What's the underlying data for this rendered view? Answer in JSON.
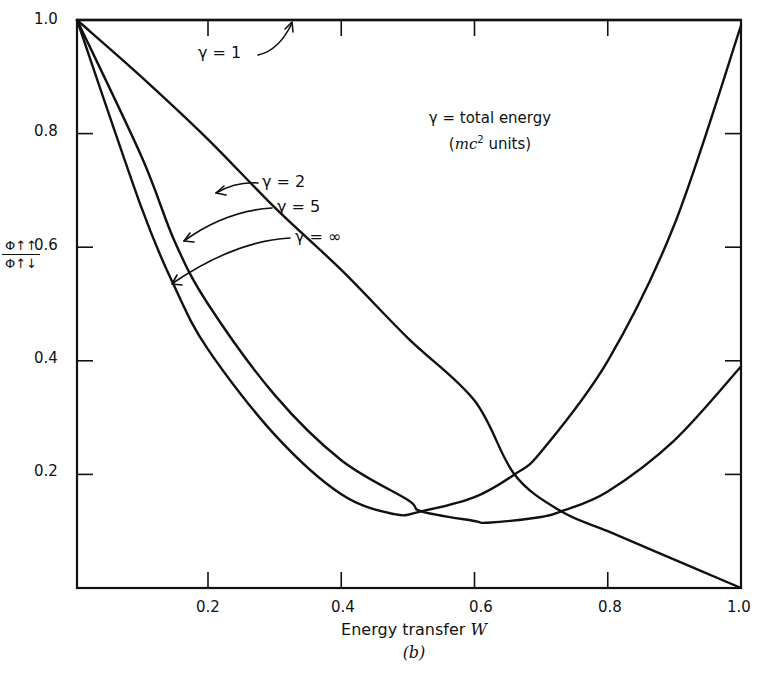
{
  "chart_data": {
    "type": "line",
    "title": "",
    "subtitle": "(b)",
    "xlabel": "Energy transfer W",
    "ylabel": "Φ↑↑ / Φ↑↓",
    "xlim": [
      0.035,
      1.0
    ],
    "ylim": [
      0.0,
      1.0
    ],
    "x_ticks": [
      0.2,
      0.4,
      0.6,
      0.8,
      1.0
    ],
    "x_tick_labels": [
      "0.2",
      "0.4",
      "0.6",
      "0.8",
      "1.0"
    ],
    "y_ticks": [
      0.2,
      0.4,
      0.6,
      0.8,
      1.0
    ],
    "y_tick_labels": [
      "0.2",
      "0.4",
      "0.6",
      "0.8",
      "1.0"
    ],
    "grid": false,
    "legend": "inline annotations with arrows",
    "annotation_note": [
      "γ = total energy",
      "(mc² units)"
    ],
    "series": [
      {
        "name": "γ = 1",
        "x": [
          0.035,
          0.2,
          0.4,
          0.6,
          0.8,
          1.0
        ],
        "y": [
          1.0,
          1.0,
          1.0,
          1.0,
          1.0,
          1.0
        ]
      },
      {
        "name": "γ = 2",
        "x": [
          0.035,
          0.1,
          0.2,
          0.3,
          0.4,
          0.5,
          0.6,
          0.66,
          0.73,
          0.8,
          0.9,
          1.0
        ],
        "y": [
          1.0,
          0.9,
          0.79,
          0.67,
          0.56,
          0.44,
          0.33,
          0.2,
          0.135,
          0.1,
          0.05,
          0.0
        ]
      },
      {
        "name": "γ = 5",
        "x": [
          0.035,
          0.1,
          0.15,
          0.2,
          0.3,
          0.4,
          0.5,
          0.52,
          0.6,
          0.62,
          0.7,
          0.73,
          0.8,
          0.9,
          1.0
        ],
        "y": [
          1.0,
          0.76,
          0.61,
          0.5,
          0.34,
          0.225,
          0.155,
          0.135,
          0.118,
          0.115,
          0.125,
          0.135,
          0.17,
          0.26,
          0.39
        ]
      },
      {
        "name": "γ = ∞",
        "x": [
          0.035,
          0.1,
          0.15,
          0.2,
          0.3,
          0.4,
          0.48,
          0.52,
          0.6,
          0.66,
          0.7,
          0.8,
          0.9,
          1.0
        ],
        "y": [
          1.0,
          0.67,
          0.53,
          0.42,
          0.27,
          0.165,
          0.13,
          0.135,
          0.16,
          0.2,
          0.24,
          0.4,
          0.64,
          0.99
        ]
      }
    ]
  },
  "labels": {
    "x_axis": "Energy transfer W",
    "x_axis_text": "Energy transfer ",
    "x_axis_var": "W",
    "panel": "(b)",
    "y_num": "Φ↑↑",
    "y_den": "Φ↑↓",
    "note_line1": "γ = total energy",
    "note_line2_pre": "(",
    "note_line2_var": "mc",
    "note_line2_sup": "2",
    "note_line2_post": " units)",
    "g1": "γ = 1",
    "g2": "γ = 2",
    "g5": "γ = 5",
    "ginf": "γ = ∞"
  }
}
